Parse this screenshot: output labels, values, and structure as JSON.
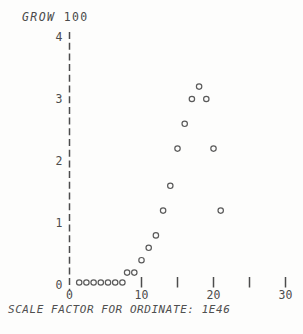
{
  "title": {
    "program": "GROW",
    "argument": "100"
  },
  "caption": "SCALE FACTOR FOR ORDINATE: 1E46",
  "colors": {
    "ink": "#4c4c4c",
    "marker_stroke": "#5a5a5a",
    "background": "#fdfdfc"
  },
  "chart_data": {
    "type": "scatter",
    "title": "GROW 100",
    "marker": "open-circle",
    "points": [
      [
        1,
        0
      ],
      [
        2,
        0
      ],
      [
        3,
        0
      ],
      [
        4,
        0
      ],
      [
        5,
        0
      ],
      [
        6,
        0
      ],
      [
        7,
        0
      ],
      [
        8,
        0.2
      ],
      [
        9,
        0.2
      ],
      [
        10,
        0.4
      ],
      [
        11,
        0.6
      ],
      [
        12,
        0.8
      ],
      [
        13,
        1.2
      ],
      [
        14,
        1.6
      ],
      [
        15,
        2.2
      ],
      [
        16,
        2.6
      ],
      [
        17,
        3.0
      ],
      [
        18,
        3.2
      ],
      [
        19,
        3.0
      ],
      [
        20,
        2.2
      ],
      [
        21,
        1.2
      ]
    ],
    "xlim": [
      0,
      32
    ],
    "ylim": [
      0,
      4
    ],
    "y_tick_labels": [
      0,
      1,
      2,
      3,
      4
    ],
    "x_tick_marks": [
      10,
      15,
      20,
      25,
      30
    ],
    "x_tick_labels": [
      0,
      10,
      20,
      30
    ],
    "y_axis_style": "dashed-line",
    "x_axis_style": "ticks-only-no-baseline",
    "grid": false,
    "legend": "none",
    "ordinate_scale_note": "SCALE FACTOR FOR ORDINATE: 1E46"
  }
}
